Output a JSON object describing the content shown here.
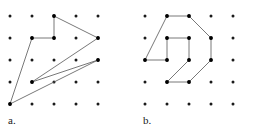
{
  "figure": {
    "width": 258,
    "height": 133,
    "background_color": "#ffffff",
    "dot_color": "#1a1a1a",
    "line_color": "#555555",
    "vertex_color": "#000000",
    "dot_radius": 1.5,
    "vertex_radius": 1.9,
    "line_width": 0.8
  },
  "panels": [
    {
      "id": "panel-a",
      "label": "a.",
      "label_position": {
        "x": 8,
        "y": 124
      },
      "grid": {
        "columns": 5,
        "rows": 5,
        "x_positions": [
          10,
          32,
          54,
          76,
          98
        ],
        "y_positions": [
          16,
          38,
          60,
          82,
          104
        ]
      },
      "polygon": {
        "name": "arrow-zigzag-polygon",
        "closed": true,
        "vertices": [
          {
            "col": 2,
            "row": 0,
            "x": 54,
            "y": 16
          },
          {
            "col": 2,
            "row": 1,
            "x": 54,
            "y": 38
          },
          {
            "col": 1,
            "row": 1,
            "x": 32,
            "y": 38
          },
          {
            "col": 0,
            "row": 4,
            "x": 10,
            "y": 104
          },
          {
            "col": 4,
            "row": 2,
            "x": 98,
            "y": 60
          },
          {
            "col": 1,
            "row": 3,
            "x": 32,
            "y": 82
          },
          {
            "col": 4,
            "row": 1,
            "x": 98,
            "y": 38
          }
        ],
        "path_d": "M 54 16 L 54 38 L 32 38 L 10 104 L 98 60 L 32 82 L 98 38 Z"
      }
    },
    {
      "id": "panel-b",
      "label": "b.",
      "label_position": {
        "x": 143,
        "y": 124
      },
      "grid": {
        "columns": 5,
        "rows": 5,
        "x_positions": [
          145,
          167,
          189,
          211,
          233
        ],
        "y_positions": [
          16,
          38,
          60,
          82,
          104
        ]
      },
      "polygon": {
        "name": "two-shape-polygon",
        "closed": true,
        "vertices": [
          {
            "col": 1,
            "row": 0,
            "x": 167,
            "y": 16
          },
          {
            "col": 2,
            "row": 0,
            "x": 189,
            "y": 16
          },
          {
            "col": 3,
            "row": 1,
            "x": 211,
            "y": 38
          },
          {
            "col": 3,
            "row": 2,
            "x": 211,
            "y": 60
          },
          {
            "col": 2,
            "row": 3,
            "x": 189,
            "y": 82
          },
          {
            "col": 1,
            "row": 3,
            "x": 167,
            "y": 82
          },
          {
            "col": 2,
            "row": 2,
            "x": 189,
            "y": 60
          },
          {
            "col": 2,
            "row": 1,
            "x": 189,
            "y": 38
          },
          {
            "col": 1,
            "row": 1,
            "x": 167,
            "y": 38
          },
          {
            "col": 1,
            "row": 2,
            "x": 167,
            "y": 60
          },
          {
            "col": 0,
            "row": 2,
            "x": 145,
            "y": 60
          }
        ],
        "path_d": "M 167 16 L 189 16 L 211 38 L 211 60 L 189 82 L 167 82 L 189 60 L 189 38 L 167 38 L 167 60 L 145 60 Z"
      }
    }
  ]
}
